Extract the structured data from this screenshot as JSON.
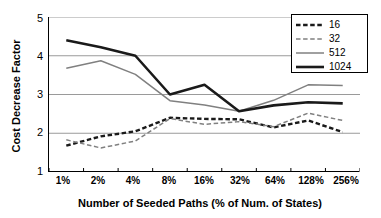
{
  "chart_data": {
    "type": "line",
    "title": "",
    "xlabel": "Number of Seeded Paths (% of Num. of States)",
    "ylabel": "Cost Decrease Factor",
    "categories": [
      "1%",
      "2%",
      "4%",
      "8%",
      "16%",
      "32%",
      "64%",
      "128%",
      "256%"
    ],
    "ylim": [
      1,
      5
    ],
    "yticks": [
      1,
      2,
      3,
      4,
      5
    ],
    "grid": true,
    "legend_position": "top-right",
    "series": [
      {
        "name": "16",
        "style": "thick-dashed",
        "color": "#1a1a1a",
        "values": [
          1.68,
          1.92,
          2.05,
          2.4,
          2.37,
          2.36,
          2.15,
          2.33,
          2.03
        ]
      },
      {
        "name": "32",
        "style": "thin-dashed",
        "color": "#808080",
        "values": [
          1.83,
          1.62,
          1.8,
          2.38,
          2.23,
          2.3,
          2.17,
          2.52,
          2.33
        ]
      },
      {
        "name": "512",
        "style": "thin-solid",
        "color": "#808080",
        "values": [
          3.68,
          3.87,
          3.52,
          2.84,
          2.73,
          2.57,
          2.85,
          3.25,
          3.23
        ]
      },
      {
        "name": "1024",
        "style": "thick-solid",
        "color": "#1a1a1a",
        "values": [
          4.4,
          4.22,
          4.0,
          3.0,
          3.25,
          2.57,
          2.72,
          2.8,
          2.77
        ]
      }
    ]
  },
  "axes": {
    "y_labels": [
      "5",
      "4",
      "3",
      "2",
      "1"
    ],
    "y_title": "Cost Decrease Factor",
    "x_title": "Number of Seeded Paths (% of Num. of States)",
    "x_labels": [
      "1%",
      "2%",
      "4%",
      "8%",
      "16%",
      "32%",
      "64%",
      "128%",
      "256%"
    ]
  },
  "legend": {
    "entries": [
      {
        "label": "16"
      },
      {
        "label": "32"
      },
      {
        "label": "512"
      },
      {
        "label": "1024"
      }
    ]
  },
  "colors": {
    "axis": "#000000",
    "grid": "#9a9a9a",
    "dark_series": "#1a1a1a",
    "gray_series": "#808080",
    "background": "#ffffff"
  }
}
